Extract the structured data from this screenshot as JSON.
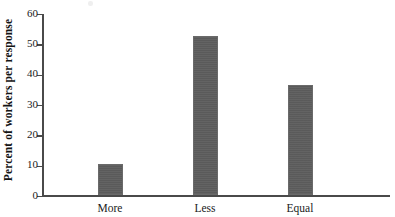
{
  "chart_data": {
    "type": "bar",
    "title": "",
    "subtitle": "",
    "xlabel": "",
    "ylabel": "Percent of workers per response",
    "categories": [
      "More",
      "Less",
      "Equal"
    ],
    "values": [
      10.3,
      52.5,
      36.2
    ],
    "series": [
      {
        "name": "Percent of workers per response",
        "values": [
          10.3,
          52.5,
          36.2
        ]
      }
    ],
    "ylim": [
      0,
      60
    ],
    "y_ticks": [
      0,
      10,
      20,
      30,
      40,
      50,
      60
    ],
    "y_tick_labels": [
      "0",
      "10",
      "20",
      "30",
      "40",
      "50",
      "60"
    ],
    "grid": false,
    "legend": false,
    "legend_position": "none",
    "bar_color": "#5d5d5d",
    "axis_color": "#4a4a4a",
    "background_color": "#ffffff",
    "annotations": []
  },
  "axes": {
    "y_title": "Percent of workers per response"
  }
}
